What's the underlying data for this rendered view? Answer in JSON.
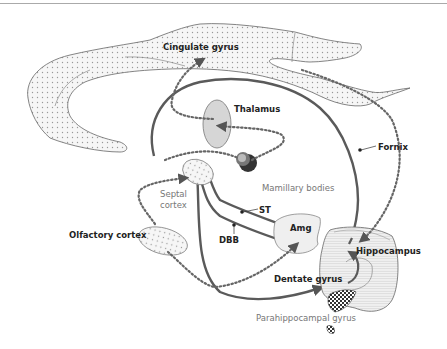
{
  "colors": {
    "pathway": "#5a5a5a",
    "dotted_pathway": "#666666",
    "stipple_fill": "#f4f4f4",
    "thalamus_fill": "#d6d6d6",
    "label_dark": "#222222",
    "label_gray": "#777777"
  },
  "labels": {
    "cingulate_gyrus": "Cingulate gyrus",
    "thalamus": "Thalamus",
    "fornix": "Fornix",
    "mamillary_bodies": "Mamillary bodies",
    "septal_cortex_line1": "Septal",
    "septal_cortex_line2": "cortex",
    "st": "ST",
    "olfactory_cortex": "Olfactory cortex",
    "dbb": "DBB",
    "amg": "Amg",
    "hippocampus": "Hippocampus",
    "dentate_gyrus": "Dentate gyrus",
    "parahippocampal_gyrus": "Parahippocampal gyrus"
  }
}
